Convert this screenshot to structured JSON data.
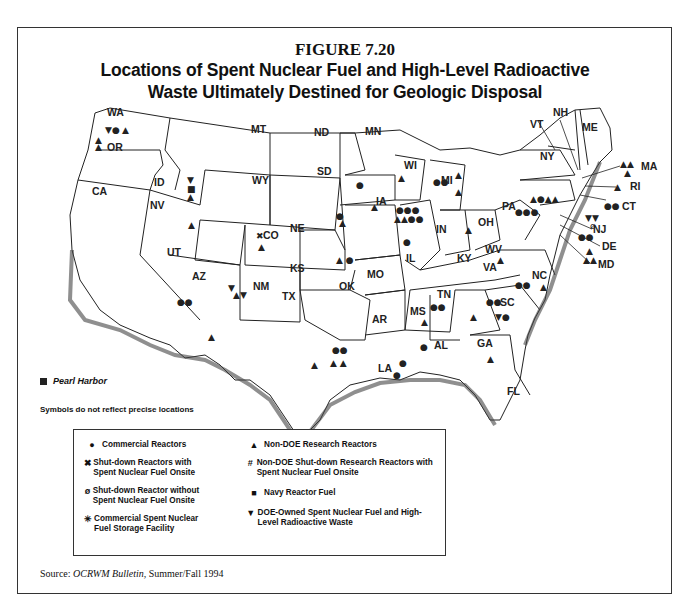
{
  "figure": {
    "number": "FIGURE 7.20",
    "title_line1": "Locations of Spent Nuclear Fuel and High-Level Radioactive",
    "title_line2": "Waste Ultimately Destined for Geologic Disposal"
  },
  "map": {
    "state_labels": [
      "WA",
      "OR",
      "CA",
      "ID",
      "NV",
      "MT",
      "WY",
      "UT",
      "AZ",
      "CO",
      "NM",
      "ND",
      "SD",
      "NE",
      "KS",
      "OK",
      "TX",
      "MN",
      "IA",
      "MO",
      "AR",
      "LA",
      "WI",
      "IL",
      "MI",
      "IN",
      "OH",
      "KY",
      "TN",
      "MS",
      "AL",
      "GA",
      "FL",
      "SC",
      "NC",
      "VA",
      "WV",
      "PA",
      "NY",
      "VT",
      "NH",
      "ME",
      "MA",
      "RI",
      "CT",
      "NJ",
      "DE",
      "MD"
    ],
    "pearl_harbor_label": "Pearl Harbor",
    "note": "Symbols do not reflect precise locations"
  },
  "legend": {
    "items": [
      {
        "symbol": "●",
        "label": "Commercial Reactors"
      },
      {
        "symbol": "✖",
        "label": "Shut-down Reactors with Spent Nuclear Fuel Onsite"
      },
      {
        "symbol": "ø",
        "label": "Shut-down Reactor without Spent Nuclear Fuel Onsite"
      },
      {
        "symbol": "✳",
        "label": "Commercial Spent Nuclear Fuel Storage Facility"
      },
      {
        "symbol": "▲",
        "label": "Non-DOE Research Reactors"
      },
      {
        "symbol": "#",
        "label": "Non-DOE Shut-down Research Reactors with Spent Nuclear Fuel Onsite"
      },
      {
        "symbol": "■",
        "label": "Navy Reactor Fuel"
      },
      {
        "symbol": "▼",
        "label": "DOE-Owned Spent Nuclear Fuel and High-Level Radioactive Waste"
      }
    ]
  },
  "source": {
    "prefix": "Source: ",
    "publication": "OCRWM Bulletin,",
    "date": " Summer/Fall 1994"
  }
}
